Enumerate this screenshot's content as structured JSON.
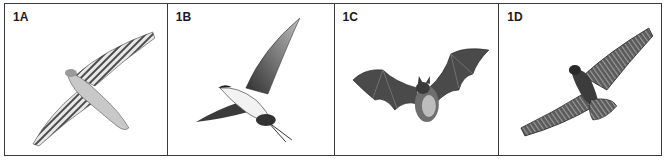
{
  "panels": [
    {
      "label": "1A",
      "subject": "hawk-in-flight-barred-underwings"
    },
    {
      "label": "1B",
      "subject": "seabird-tern-in-flight"
    },
    {
      "label": "1C",
      "subject": "bat-in-flight"
    },
    {
      "label": "1D",
      "subject": "eagle-soaring"
    }
  ],
  "colors": {
    "border": "#3a3a3a",
    "background": "#ffffff",
    "ink": "#2b2b2b"
  }
}
